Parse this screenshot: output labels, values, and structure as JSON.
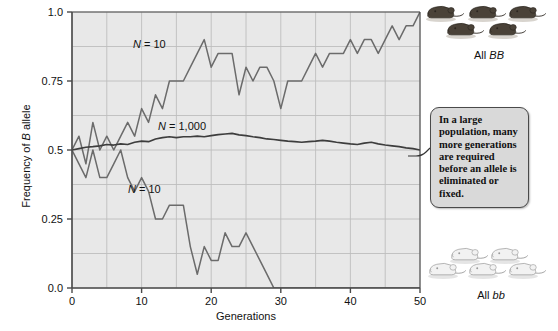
{
  "axes": {
    "x_title": "Generations",
    "y_title_prefix": "Frequency of ",
    "y_title_italic": "B",
    "y_title_suffix": " allele",
    "x_ticks": [
      "0",
      "10",
      "20",
      "30",
      "40",
      "50"
    ],
    "y_ticks": [
      "0.0",
      "0.25",
      "0.5",
      "0.75",
      "1.0"
    ]
  },
  "series_labels": {
    "upper_small": {
      "n": "N",
      "eq": " = ",
      "value": "10"
    },
    "large": {
      "n": "N",
      "eq": " = ",
      "value": "1,000"
    },
    "lower_small": {
      "n": "N",
      "eq": " = ",
      "value": "10"
    }
  },
  "callout": {
    "text": "In a large population, many more generations are required before an allele is eliminated or fixed."
  },
  "mice_top": {
    "caption_prefix": "All ",
    "caption_genotype": "BB",
    "count": 5,
    "color": "#4a4238"
  },
  "mice_bottom": {
    "caption_prefix": "All ",
    "caption_genotype": "bb",
    "count": 5,
    "color": "#f2f2f2"
  },
  "colors": {
    "plot_background": "#e8e8e8",
    "gridline": "#bdbdbd",
    "axis": "#4a4a4a",
    "line_small_upper": "#6b6b6b",
    "line_large": "#3d3d3d",
    "line_small_lower": "#6b6b6b",
    "callout_background": "#d9d9d9",
    "callout_border": "#4a4a4a"
  },
  "chart_data": {
    "type": "line",
    "title": "",
    "xlabel": "Generations",
    "ylabel": "Frequency of B allele",
    "xlim": [
      0,
      50
    ],
    "ylim": [
      0,
      1
    ],
    "grid": true,
    "legend": "inline-annotations",
    "x": [
      0,
      1,
      2,
      3,
      4,
      5,
      6,
      7,
      8,
      9,
      10,
      11,
      12,
      13,
      14,
      15,
      16,
      17,
      18,
      19,
      20,
      21,
      22,
      23,
      24,
      25,
      26,
      27,
      28,
      29,
      30,
      31,
      32,
      33,
      34,
      35,
      36,
      37,
      38,
      39,
      40,
      41,
      42,
      43,
      44,
      45,
      46,
      47,
      48,
      49,
      50
    ],
    "series": [
      {
        "name": "N = 10 (fixed for B)",
        "label": "N = 10",
        "color": "#6b6b6b",
        "values": [
          0.5,
          0.55,
          0.45,
          0.6,
          0.5,
          0.55,
          0.5,
          0.55,
          0.6,
          0.55,
          0.65,
          0.6,
          0.7,
          0.65,
          0.75,
          0.75,
          0.75,
          0.8,
          0.85,
          0.9,
          0.8,
          0.85,
          0.85,
          0.85,
          0.7,
          0.8,
          0.75,
          0.8,
          0.8,
          0.75,
          0.65,
          0.75,
          0.75,
          0.75,
          0.8,
          0.85,
          0.8,
          0.85,
          0.85,
          0.85,
          0.9,
          0.85,
          0.9,
          0.9,
          0.85,
          0.9,
          0.95,
          0.9,
          0.95,
          0.95,
          1.0
        ]
      },
      {
        "name": "N = 1,000",
        "label": "N = 1,000",
        "color": "#3d3d3d",
        "values": [
          0.5,
          0.505,
          0.51,
          0.512,
          0.515,
          0.52,
          0.518,
          0.522,
          0.52,
          0.528,
          0.532,
          0.53,
          0.54,
          0.545,
          0.548,
          0.545,
          0.548,
          0.548,
          0.55,
          0.548,
          0.552,
          0.556,
          0.558,
          0.56,
          0.555,
          0.552,
          0.548,
          0.545,
          0.54,
          0.538,
          0.535,
          0.532,
          0.53,
          0.528,
          0.53,
          0.532,
          0.535,
          0.532,
          0.528,
          0.525,
          0.522,
          0.52,
          0.525,
          0.528,
          0.522,
          0.518,
          0.515,
          0.512,
          0.508,
          0.505,
          0.5
        ]
      },
      {
        "name": "N = 10 (lost B)",
        "label": "N = 10",
        "color": "#6b6b6b",
        "values": [
          0.5,
          0.45,
          0.4,
          0.5,
          0.4,
          0.4,
          0.45,
          0.5,
          0.4,
          0.35,
          0.4,
          0.35,
          0.25,
          0.25,
          0.3,
          0.3,
          0.3,
          0.15,
          0.05,
          0.15,
          0.1,
          0.1,
          0.2,
          0.15,
          0.15,
          0.2,
          0.15,
          0.1,
          0.05,
          0.0,
          0.0,
          0.0,
          0.0,
          0.0,
          0.0,
          0.0,
          0.0,
          0.0,
          0.0,
          0.0,
          0.0,
          0.0,
          0.0,
          0.0,
          0.0,
          0.0,
          0.0,
          0.0,
          0.0,
          0.0,
          0.0
        ]
      }
    ]
  }
}
